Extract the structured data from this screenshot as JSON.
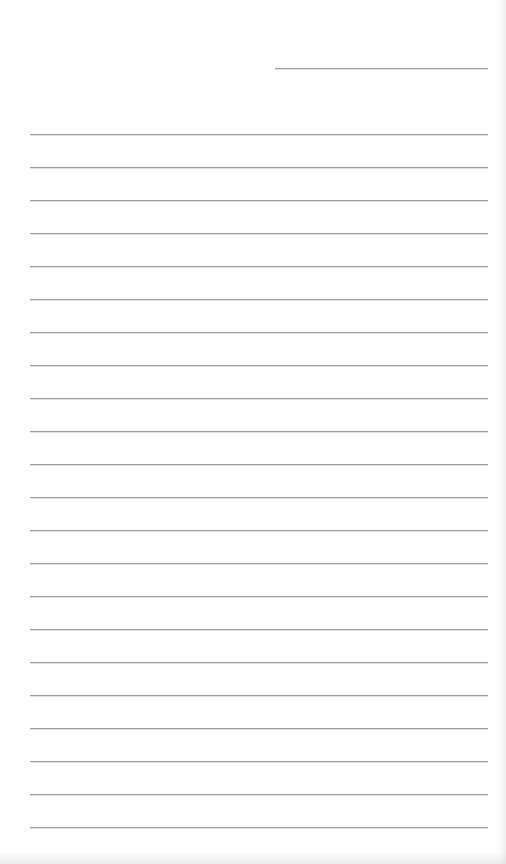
{
  "document": {
    "type": "lined-paper",
    "background_color": "#fefefe",
    "line_color": "#9c9c9c",
    "header_line": {
      "x1": 275,
      "x2": 488,
      "y": 68
    },
    "ruled_lines": {
      "count": 22,
      "x1": 30,
      "x2": 488,
      "first_y": 134,
      "spacing": 33
    }
  }
}
